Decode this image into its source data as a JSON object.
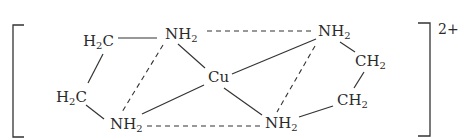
{
  "diagram": {
    "charge": "2+",
    "atoms": [
      {
        "id": "c1",
        "element": "C",
        "h": "2",
        "h_first": true,
        "label_main": "H",
        "label_sub": "2",
        "label_tail": "C",
        "x": 83,
        "y": 34
      },
      {
        "id": "n1",
        "element": "N",
        "label_main": "NH",
        "label_sub": "2",
        "label_tail": "",
        "x": 165,
        "y": 27
      },
      {
        "id": "c2",
        "element": "C",
        "label_main": "H",
        "label_sub": "2",
        "label_tail": "C",
        "x": 56,
        "y": 90
      },
      {
        "id": "n2",
        "element": "N",
        "label_main": "NH",
        "label_sub": "2",
        "label_tail": "",
        "x": 110,
        "y": 117
      },
      {
        "id": "cu",
        "element": "Cu",
        "label_main": "Cu",
        "label_sub": "",
        "label_tail": "",
        "x": 208,
        "y": 70
      },
      {
        "id": "n3",
        "element": "N",
        "label_main": "NH",
        "label_sub": "2",
        "label_tail": "",
        "x": 318,
        "y": 24
      },
      {
        "id": "c3",
        "element": "C",
        "label_main": "CH",
        "label_sub": "2",
        "label_tail": "",
        "x": 355,
        "y": 54
      },
      {
        "id": "c4",
        "element": "C",
        "label_main": "CH",
        "label_sub": "2",
        "label_tail": "",
        "x": 337,
        "y": 93
      },
      {
        "id": "n4",
        "element": "N",
        "label_main": "NH",
        "label_sub": "2",
        "label_tail": "",
        "x": 265,
        "y": 116
      }
    ],
    "bonds": [
      {
        "from": "c1",
        "to": "n1",
        "style": "solid"
      },
      {
        "from": "c1",
        "to": "c2",
        "style": "solid"
      },
      {
        "from": "c2",
        "to": "n2",
        "style": "solid"
      },
      {
        "from": "n1",
        "to": "cu",
        "style": "solid"
      },
      {
        "from": "n2",
        "to": "cu",
        "style": "solid"
      },
      {
        "from": "n3",
        "to": "cu",
        "style": "solid"
      },
      {
        "from": "n4",
        "to": "cu",
        "style": "solid"
      },
      {
        "from": "n3",
        "to": "c3",
        "style": "solid"
      },
      {
        "from": "c3",
        "to": "c4",
        "style": "solid"
      },
      {
        "from": "c4",
        "to": "n4",
        "style": "solid"
      },
      {
        "from": "n1",
        "to": "n2",
        "style": "dashed"
      },
      {
        "from": "n3",
        "to": "n4",
        "style": "dashed"
      },
      {
        "from": "n1",
        "to": "n3",
        "style": "dashed"
      },
      {
        "from": "n2",
        "to": "n4",
        "style": "dashed"
      }
    ],
    "brackets": [
      "left-square-bracket",
      "right-square-bracket"
    ]
  }
}
